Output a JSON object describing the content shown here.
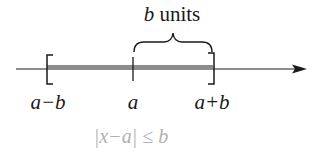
{
  "diagram": {
    "type": "number-line-interval",
    "brace_label": {
      "var": "b",
      "text": "units"
    },
    "points": [
      {
        "id": "left",
        "label": "a−b",
        "x": 46,
        "bracket": "closed-left"
      },
      {
        "id": "center",
        "label": "a",
        "x": 133,
        "tick": true
      },
      {
        "id": "right",
        "label": "a+b",
        "x": 214,
        "bracket": "closed-right"
      }
    ],
    "labels": {
      "left": "a−b",
      "center": "a",
      "right": "a+b"
    },
    "formula": "|x−a| ≤ b",
    "colors": {
      "axis": "#1a1a1a",
      "interval_fill": "#8c8c8c",
      "formula": "#b0b0b0"
    },
    "axis": {
      "x_start": 16,
      "x_end": 305,
      "y": 69,
      "arrow": "right"
    }
  }
}
